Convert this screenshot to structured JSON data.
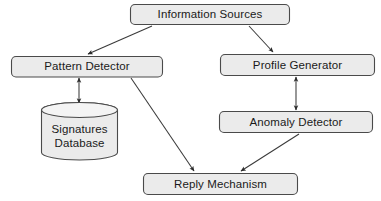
{
  "diagram": {
    "background_color": "#ffffff",
    "node_fill_color": "#ebebeb",
    "node_stroke_color": "#4a4a4a",
    "edge_color": "#3a3a3a",
    "text_color": "#1a1a1a",
    "nodes": [
      {
        "id": "information-sources",
        "label": "Information Sources",
        "shape": "rounded-rectangle",
        "x": 130,
        "y": 4,
        "width": 160,
        "height": 21
      },
      {
        "id": "pattern-detector",
        "label": "Pattern Detector",
        "shape": "rounded-rectangle",
        "x": 11,
        "y": 56,
        "width": 152,
        "height": 21
      },
      {
        "id": "profile-generator",
        "label": "Profile Generator",
        "shape": "rounded-rectangle",
        "x": 220,
        "y": 54,
        "width": 155,
        "height": 22
      },
      {
        "id": "signatures-database",
        "label_line1": "Signatures",
        "label_line2": "Database",
        "shape": "cylinder",
        "x": 41,
        "y": 104,
        "width": 76,
        "height": 55
      },
      {
        "id": "anomaly-detector",
        "label": "Anomaly Detector",
        "shape": "rounded-rectangle",
        "x": 219,
        "y": 111,
        "width": 154,
        "height": 22
      },
      {
        "id": "reply-mechanism",
        "label": "Reply Mechanism",
        "shape": "rounded-rectangle",
        "x": 143,
        "y": 173,
        "width": 155,
        "height": 22
      }
    ],
    "edges": [
      {
        "id": "edge-sources-to-pattern",
        "from": "information-sources",
        "to": "pattern-detector",
        "arrowheads": "single",
        "direction": "down-left"
      },
      {
        "id": "edge-sources-to-profile",
        "from": "information-sources",
        "to": "profile-generator",
        "arrowheads": "single",
        "direction": "down-right"
      },
      {
        "id": "edge-pattern-to-database",
        "from": "pattern-detector",
        "to": "signatures-database",
        "arrowheads": "double",
        "direction": "vertical"
      },
      {
        "id": "edge-profile-to-anomaly",
        "from": "profile-generator",
        "to": "anomaly-detector",
        "arrowheads": "double",
        "direction": "vertical"
      },
      {
        "id": "edge-pattern-to-reply",
        "from": "pattern-detector",
        "to": "reply-mechanism",
        "arrowheads": "single",
        "direction": "down-right"
      },
      {
        "id": "edge-anomaly-to-reply",
        "from": "anomaly-detector",
        "to": "reply-mechanism",
        "arrowheads": "single",
        "direction": "down-left"
      }
    ]
  }
}
